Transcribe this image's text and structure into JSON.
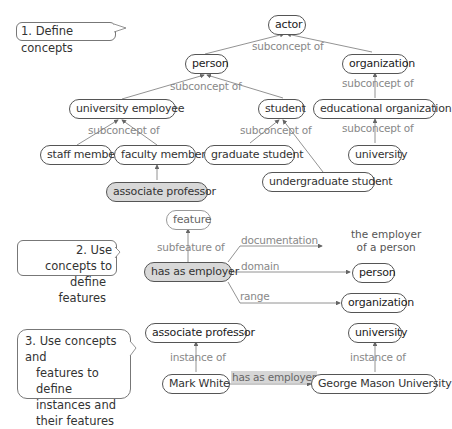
{
  "callouts": {
    "step1": "1. Define concepts",
    "step2": [
      "2. Use concepts to",
      "define features"
    ],
    "step3": [
      "3. Use concepts and",
      "features to define",
      "instances and",
      "their features"
    ]
  },
  "concepts": {
    "actor": "actor",
    "person": "person",
    "organization": "organization",
    "university_employee": "university employee",
    "student": "student",
    "educational_organization": "educational organization",
    "staff_member": "staff member",
    "faculty_member": "faculty member",
    "graduate_student": "graduate student",
    "university": "university",
    "undergraduate_student": "undergraduate student",
    "associate_professor": "associate professor"
  },
  "relations": {
    "subconcept_of": "subconcept of",
    "subfeature_of": "subfeature of",
    "documentation": "documentation",
    "domain": "domain",
    "range": "range",
    "instance_of": "instance of",
    "has_as_employer": "has as employer"
  },
  "features": {
    "feature": "feature",
    "has_as_employer": "has as employer",
    "doc_text": [
      "the employer",
      "of a person"
    ],
    "domain_value": "person",
    "range_value": "organization"
  },
  "instances": {
    "class_left": "associate professor",
    "class_right": "university",
    "mark_white": "Mark White",
    "gmu": "George Mason University"
  },
  "colors": {
    "edge": "#666666",
    "relation_text": "#888888",
    "highlight_fill": "#d8d8d8"
  }
}
